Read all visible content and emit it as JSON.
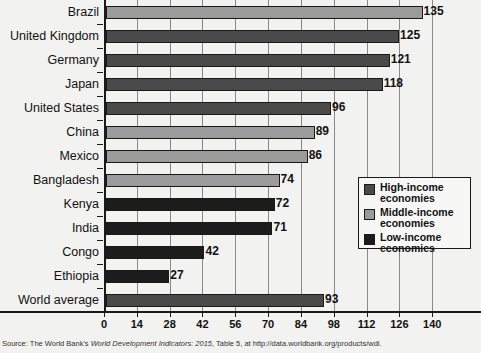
{
  "chart_data": {
    "type": "bar",
    "orientation": "horizontal",
    "title": "",
    "subtitle": "",
    "xlabel": "",
    "ylabel": "",
    "xlim": [
      0,
      145
    ],
    "xticks": [
      0,
      14,
      28,
      42,
      56,
      70,
      84,
      98,
      112,
      126,
      140
    ],
    "grid": true,
    "grid_axis": "x",
    "legend_position": "middle-right-inside",
    "categories": [
      "Brazil",
      "United Kingdom",
      "Germany",
      "Japan",
      "United States",
      "China",
      "Mexico",
      "Bangladesh",
      "Kenya",
      "India",
      "Congo",
      "Ethiopia",
      "World average"
    ],
    "values": [
      135,
      125,
      121,
      118,
      96,
      89,
      86,
      74,
      72,
      71,
      42,
      27,
      93
    ],
    "value_labels": [
      "135",
      "125",
      "121",
      "118",
      "96",
      "89",
      "86",
      "74",
      "72",
      "71",
      "42",
      "27",
      "93"
    ],
    "groups": [
      "middle-income",
      "high-income",
      "high-income",
      "high-income",
      "high-income",
      "middle-income",
      "middle-income",
      "middle-income",
      "low-income",
      "low-income",
      "low-income",
      "low-income",
      "high-income"
    ],
    "series": [
      {
        "name": "High-income economies",
        "color": "#4a4a4a",
        "members": [
          "United Kingdom",
          "Germany",
          "Japan",
          "United States",
          "World average"
        ]
      },
      {
        "name": "Middle-income economies",
        "color": "#9b9b9b",
        "members": [
          "Brazil",
          "China",
          "Mexico",
          "Bangladesh"
        ]
      },
      {
        "name": "Low-income economies",
        "color": "#1c1c1c",
        "members": [
          "Kenya",
          "India",
          "Congo",
          "Ethiopia"
        ]
      }
    ],
    "legend": [
      {
        "label_line1": "High-income",
        "label_line2": "economies",
        "color": "#4a4a4a"
      },
      {
        "label_line1": "Middle-income",
        "label_line2": "economies",
        "color": "#9b9b9b"
      },
      {
        "label_line1": "Low-income",
        "label_line2": "economies",
        "color": "#1c1c1c"
      }
    ]
  },
  "source": {
    "prefix": "Source:  The World Bank's ",
    "italic": "World Development Indicators: 2015",
    "suffix": ", Table 5, at http://data.worldbank.org/products/wdi."
  },
  "colors": {
    "high_income": "#4a4a4a",
    "middle_income": "#9b9b9b",
    "low_income": "#1c1c1c",
    "axis": "#1a1a1a",
    "grid": "#8a8a8a",
    "background": "#f2f2f0"
  }
}
